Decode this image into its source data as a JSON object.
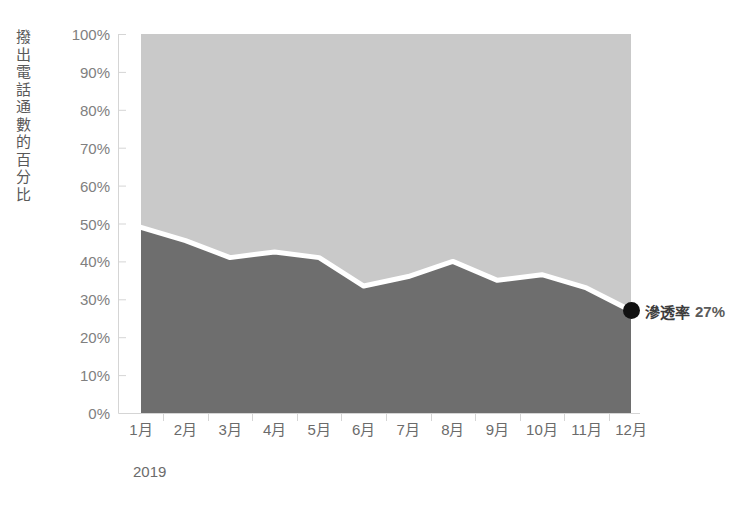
{
  "chart_data": {
    "type": "area",
    "title": "",
    "subtitle": "",
    "xlabel": "",
    "ylabel": "撥出電話通數的百分比",
    "year_caption": "2019",
    "categories": [
      "1月",
      "2月",
      "3月",
      "4月",
      "5月",
      "6月",
      "7月",
      "8月",
      "9月",
      "10月",
      "11月",
      "12月"
    ],
    "ylim": [
      0,
      100
    ],
    "ytick_labels": [
      "0%",
      "10%",
      "20%",
      "30%",
      "40%",
      "50%",
      "60%",
      "70%",
      "80%",
      "90%",
      "100%"
    ],
    "ytick_values": [
      0,
      10,
      20,
      30,
      40,
      50,
      60,
      70,
      80,
      90,
      100
    ],
    "grid": false,
    "legend_position": "none",
    "stacked": true,
    "series": [
      {
        "name": "滲透率",
        "color": "#6e6e6e",
        "values": [
          49,
          45.5,
          41,
          42.5,
          41,
          33.5,
          36,
          40,
          35,
          36.5,
          33,
          27
        ]
      },
      {
        "name": "其餘",
        "color": "#c9c9c9",
        "values": [
          51,
          54.5,
          59,
          57.5,
          59,
          66.5,
          64,
          60,
          65,
          63.5,
          67,
          73
        ]
      }
    ],
    "divider_line_color": "#ffffff",
    "annotations": [
      {
        "name": "滲透率",
        "value": "27%",
        "at_category": "12月",
        "at_value": 27,
        "marker": "filled-circle",
        "marker_color": "#111111"
      }
    ],
    "axis_color": "#d5d5d5",
    "tick_label_color": "#808080"
  }
}
